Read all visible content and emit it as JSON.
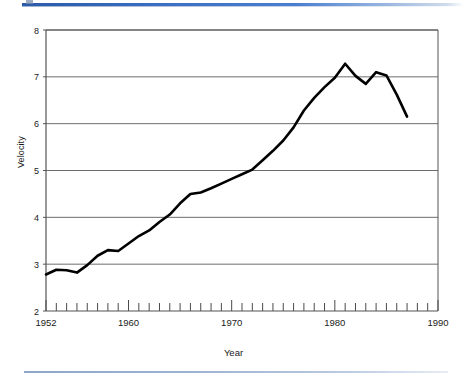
{
  "figure": {
    "decoration": {
      "top_rule_color": "#3a6ec2",
      "bottom_rule_color": "#9db3d2"
    }
  },
  "chart_data": {
    "type": "line",
    "title": "",
    "xlabel": "Year",
    "ylabel": "Velocity",
    "xlim": [
      1952,
      1990
    ],
    "ylim": [
      2,
      8
    ],
    "grid": "horizontal",
    "legend": "none",
    "x_tick_labels": [
      "1952",
      "1960",
      "1970",
      "1980",
      "1990"
    ],
    "x_tick_label_values": [
      1952,
      1960,
      1970,
      1980,
      1990
    ],
    "x_minor_tick_interval": 1,
    "y_tick_labels": [
      "8",
      "7",
      "6",
      "5",
      "4",
      "3",
      "2"
    ],
    "y_tick_label_values": [
      8,
      7,
      6,
      5,
      4,
      3,
      2
    ],
    "series": [
      {
        "name": "Velocity",
        "color": "#000000",
        "line_width": 2.6,
        "x": [
          1952,
          1953,
          1954,
          1955,
          1956,
          1957,
          1958,
          1959,
          1960,
          1961,
          1962,
          1963,
          1964,
          1965,
          1966,
          1967,
          1968,
          1969,
          1970,
          1971,
          1972,
          1973,
          1974,
          1975,
          1976,
          1977,
          1978,
          1979,
          1980,
          1981,
          1982,
          1983,
          1984,
          1985,
          1986,
          1987
        ],
        "values": [
          2.78,
          2.88,
          2.87,
          2.82,
          2.98,
          3.18,
          3.3,
          3.28,
          3.44,
          3.6,
          3.72,
          3.9,
          4.06,
          4.3,
          4.5,
          4.53,
          4.62,
          4.72,
          4.82,
          4.92,
          5.02,
          5.22,
          5.42,
          5.64,
          5.92,
          6.28,
          6.55,
          6.78,
          6.98,
          7.28,
          7.02,
          6.85,
          7.1,
          7.03,
          6.62,
          6.15
        ]
      }
    ]
  }
}
